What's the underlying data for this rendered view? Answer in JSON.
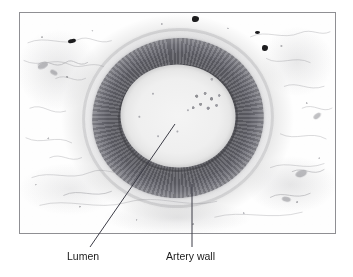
{
  "figure": {
    "kind": "histology-micrograph",
    "background_color": "#ffffff",
    "frame": {
      "border_color": "#8f8f93",
      "fill_color": "#fdfdfd"
    }
  },
  "micrograph": {
    "lumen": {
      "name": "Lumen",
      "color": "#efefef"
    },
    "artery_wall": {
      "name": "Artery wall",
      "color": "#62626a"
    },
    "adventitia": {
      "name": "Adventitia",
      "color": "#b4b4b9"
    },
    "surrounding_tissue": {
      "name": "Connective tissue",
      "color": "#ffffff"
    }
  },
  "callouts": [
    {
      "id": "lumen",
      "label": "Lumen",
      "leader": "diagonal",
      "target": "lumen-interior"
    },
    {
      "id": "artery-wall",
      "label": "Artery wall",
      "leader": "vertical",
      "target": "muscular-wall-ring"
    }
  ],
  "colors": {
    "text": "#1a1a1a",
    "leader_line": "#3c3c46",
    "frame_border": "#8f8f93"
  }
}
